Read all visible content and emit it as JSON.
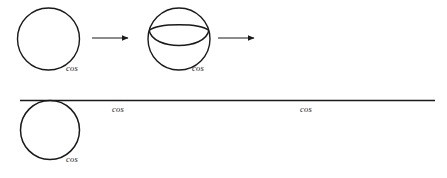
{
  "figure": {
    "title": "",
    "background_color": "#ffffff",
    "stroke_color": "#1a1a1a",
    "label_color": "#1a1a1a",
    "labels": {
      "cos": "cos"
    },
    "rows": [
      {
        "name": "transformation-sequence-row",
        "items": [
          {
            "kind": "circle",
            "name": "plain-circle",
            "cx": 48.5,
            "cy": 39,
            "r": 31,
            "stroke_width": 1.4,
            "label": "cos",
            "label_x": 66,
            "label_y": 71
          },
          {
            "kind": "arrow",
            "name": "transform-arrow-1",
            "x1": 92,
            "x2": 129,
            "y": 38,
            "stroke_width": 1.1
          },
          {
            "kind": "circle-with-arc",
            "name": "circle-with-inner-bowl-arc",
            "cx": 179,
            "cy": 39,
            "r": 31,
            "stroke_width": 1.4,
            "arc_stroke_width": 1.4,
            "label": "cos",
            "label_x": 192,
            "label_y": 71
          },
          {
            "kind": "arrow",
            "name": "transform-arrow-2",
            "x1": 218,
            "x2": 255,
            "y": 38,
            "stroke_width": 1.1
          }
        ]
      },
      {
        "name": "circle-on-line-row",
        "items": [
          {
            "kind": "line",
            "name": "horizontal-baseline",
            "x1": 20,
            "x2": 435,
            "y": 100.5,
            "stroke_width": 1.5
          },
          {
            "kind": "circle",
            "name": "tangent-circle",
            "cx": 50,
            "cy": 130,
            "r": 29.5,
            "stroke_width": 1.5,
            "label": "cos",
            "label_x": 66,
            "label_y": 162
          },
          {
            "kind": "label-only",
            "name": "line-label-left",
            "label": "cos",
            "label_x": 112,
            "label_y": 112
          },
          {
            "kind": "label-only",
            "name": "line-label-right",
            "label": "cos",
            "label_x": 300,
            "label_y": 112
          }
        ]
      }
    ]
  }
}
